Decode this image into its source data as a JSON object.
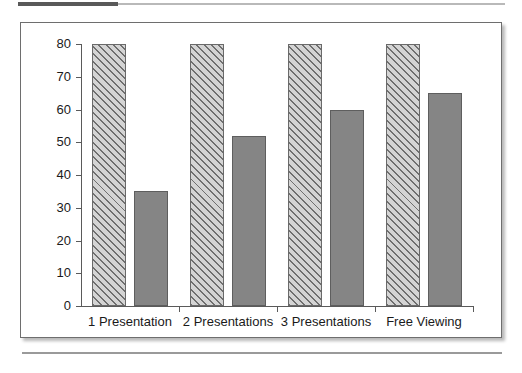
{
  "figure": {
    "header_rule": "decorative-rule",
    "footer_rule": "decorative-rule"
  },
  "chart_data": {
    "type": "bar",
    "title": "",
    "subtitle": "",
    "xlabel": "",
    "ylabel": "",
    "ylim": [
      0,
      80
    ],
    "ytick_values": [
      80,
      70,
      60,
      50,
      40,
      30,
      20,
      10,
      0
    ],
    "ytick_labels": [
      "80",
      "70",
      "60",
      "50",
      "40",
      "30",
      "20",
      "10",
      "0"
    ],
    "grid": false,
    "legend": "none",
    "categories": [
      "1 Presentation",
      "2 Presentations",
      "3 Presentations",
      "Free Viewing"
    ],
    "series": [
      {
        "name": "hatched-series",
        "pattern": "diagonal-hatch",
        "fill": "#d4d4d4",
        "hatch_color": "#6f6f6f",
        "edge": "#6a6a6a",
        "values": [
          80,
          80,
          80,
          80
        ]
      },
      {
        "name": "solid-series",
        "pattern": "solid",
        "fill": "#858585",
        "edge": "#5e5e5e",
        "values": [
          35,
          52,
          60,
          65
        ]
      }
    ]
  }
}
